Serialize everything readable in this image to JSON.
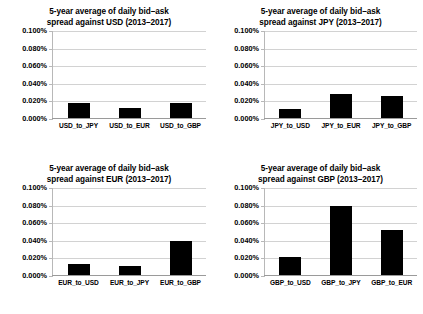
{
  "figure": {
    "background_color": "#ffffff",
    "bar_color": "#000000",
    "gridline_color": "#d2d2d2",
    "axis_color": "#b8b8b8"
  },
  "chart_data": [
    {
      "type": "bar",
      "title": "5-year average of daily bid–ask spread against USD (2013–2017)",
      "title_lines": [
        "5-year average of daily bid–ask",
        "spread against USD (2013–2017)"
      ],
      "categories": [
        "USD_to_JPY",
        "USD_to_EUR",
        "USD_to_GBP"
      ],
      "values": [
        0.018,
        0.013,
        0.018
      ],
      "xlabel": "",
      "ylabel": "",
      "ylim": [
        0.0,
        0.1
      ],
      "ytick_values": [
        0.0,
        0.02,
        0.04,
        0.06,
        0.08,
        0.1
      ],
      "ytick_labels": [
        "0.000%",
        "0.020%",
        "0.040%",
        "0.060%",
        "0.080%",
        "0.100%"
      ],
      "grid": true,
      "legend": "none"
    },
    {
      "type": "bar",
      "title": "5-year average of daily bid–ask spread against JPY (2013–2017)",
      "title_lines": [
        "5-year average of daily bid–ask",
        "spread against JPY (2013–2017)"
      ],
      "categories": [
        "JPY_to_USD",
        "JPY_to_EUR",
        "JPY_to_GBP"
      ],
      "values": [
        0.011,
        0.028,
        0.026
      ],
      "xlabel": "",
      "ylabel": "",
      "ylim": [
        0.0,
        0.1
      ],
      "ytick_values": [
        0.0,
        0.02,
        0.04,
        0.06,
        0.08,
        0.1
      ],
      "ytick_labels": [
        "0.000%",
        "0.020%",
        "0.040%",
        "0.060%",
        "0.080%",
        "0.100%"
      ],
      "grid": true,
      "legend": "none"
    },
    {
      "type": "bar",
      "title": "5-year average of daily bid–ask spread against EUR (2013–2017)",
      "title_lines": [
        "5-year average of daily bid–ask",
        "spread against EUR (2013–2017)"
      ],
      "categories": [
        "EUR_to_USD",
        "EUR_to_JPY",
        "EUR_to_GBP"
      ],
      "values": [
        0.014,
        0.011,
        0.04
      ],
      "xlabel": "",
      "ylabel": "",
      "ylim": [
        0.0,
        0.1
      ],
      "ytick_values": [
        0.0,
        0.02,
        0.04,
        0.06,
        0.08,
        0.1
      ],
      "ytick_labels": [
        "0.000%",
        "0.020%",
        "0.040%",
        "0.060%",
        "0.080%",
        "0.100%"
      ],
      "grid": true,
      "legend": "none"
    },
    {
      "type": "bar",
      "title": "5-year average of daily bid–ask spread against GBP (2013–2017)",
      "title_lines": [
        "5-year average of daily bid–ask",
        "spread against GBP (2013–2017)"
      ],
      "categories": [
        "GBP_to_USD",
        "GBP_to_JPY",
        "GBP_to_EUR"
      ],
      "values": [
        0.022,
        0.08,
        0.052
      ],
      "xlabel": "",
      "ylabel": "",
      "ylim": [
        0.0,
        0.1
      ],
      "ytick_values": [
        0.0,
        0.02,
        0.04,
        0.06,
        0.08,
        0.1
      ],
      "ytick_labels": [
        "0.000%",
        "0.020%",
        "0.040%",
        "0.060%",
        "0.080%",
        "0.100%"
      ],
      "grid": true,
      "legend": "none"
    }
  ]
}
